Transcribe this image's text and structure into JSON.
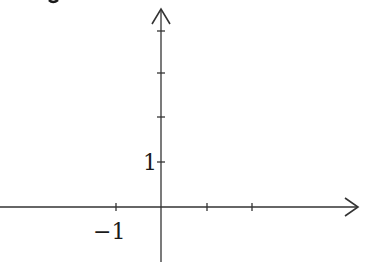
{
  "diagram": {
    "type": "coordinate-axes",
    "x_axis": {
      "tick_labels": [
        {
          "value": -1,
          "label": "−1"
        }
      ],
      "ticks_px": [
        116,
        207,
        252
      ],
      "arrow": "right"
    },
    "y_axis": {
      "tick_labels": [
        {
          "value": 1,
          "label": "1"
        }
      ],
      "ticks_px": [
        31,
        73,
        117,
        162
      ],
      "arrow": "up"
    },
    "partial_text_top": "y",
    "colors": {
      "stroke": "#333333",
      "text": "#1a1a1a",
      "background": "#ffffff"
    }
  }
}
